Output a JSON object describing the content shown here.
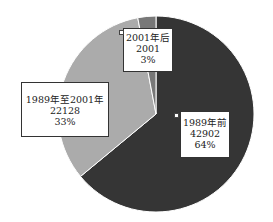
{
  "chart_data": {
    "type": "pie",
    "title": "",
    "slices": [
      {
        "label": "1989年前",
        "value": 42902,
        "percent": "64%",
        "color": "#353535"
      },
      {
        "label": "1989年至2001年",
        "value": 22128,
        "percent": "33%",
        "color": "#ababab"
      },
      {
        "label": "2001年后",
        "value": 2001,
        "percent": "3%",
        "color": "#787878"
      }
    ],
    "start_angle": "top, clockwise",
    "legend": "none (data labels on slices)"
  },
  "labels": {
    "before1989": {
      "name": "1989年前",
      "value": "42902",
      "percent": "64%"
    },
    "mid": {
      "name": "1989年至2001年",
      "value": "22128",
      "percent": "33%"
    },
    "after2001": {
      "name": "2001年后",
      "value": "2001",
      "percent": "3%"
    }
  }
}
